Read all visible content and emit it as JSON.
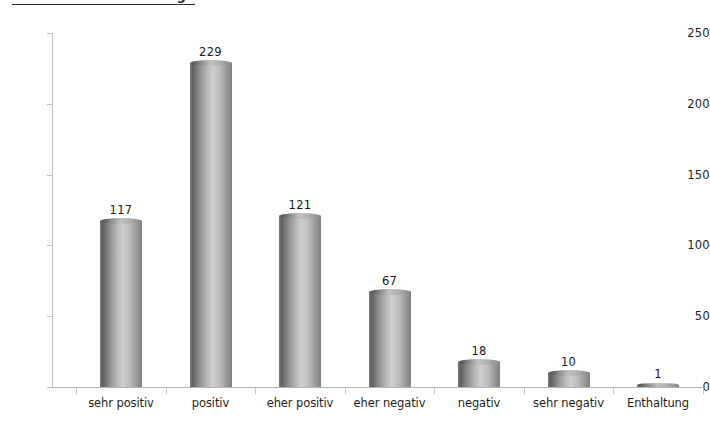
{
  "chart_data": {
    "type": "bar",
    "title": "",
    "xlabel": "",
    "ylabel": "",
    "categories": [
      "sehr positiv",
      "positiv",
      "eher positiv",
      "eher negativ",
      "negativ",
      "sehr negativ",
      "Enthaltung"
    ],
    "values": [
      117,
      229,
      121,
      67,
      18,
      10,
      1
    ],
    "ylim": [
      0,
      250
    ],
    "yticks": [
      0,
      50,
      100,
      150,
      200,
      250
    ],
    "ytick_labels": [
      "0",
      "50",
      "100",
      "150",
      "200",
      "250"
    ],
    "value_labels": [
      "117",
      "229",
      "121",
      "67",
      "18",
      "10",
      "1"
    ],
    "grid": false,
    "legend": "none",
    "bar_style": "cylinder",
    "colors": {
      "bar_dark": "#5f5f5f",
      "bar_light": "#cfcfcf",
      "axis": "#bdbdbd",
      "text": "#1a1a1a",
      "background": "#ffffff"
    }
  },
  "header": {
    "cropped_title": "Antworten auf die Frage"
  }
}
